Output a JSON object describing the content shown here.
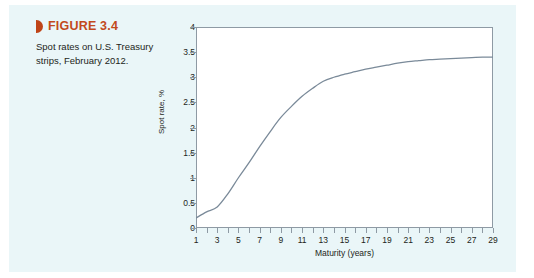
{
  "figure": {
    "marker_icon": "triangle-right-icon",
    "label": "FIGURE 3.4",
    "description": "Spot rates on U.S. Treasury strips, February 2012.",
    "heading_color": "#c2491c",
    "marker_color": "#bf4417",
    "panel_background": "#eaf6f8"
  },
  "chart_data": {
    "type": "line",
    "title": "",
    "xlabel": "Maturity (years)",
    "ylabel": "Spot rate, %",
    "xlim": [
      1,
      29
    ],
    "ylim": [
      0,
      4
    ],
    "grid": false,
    "legend": "none",
    "line_color": "#7a8a99",
    "plot_background": "#ffffff",
    "axis_color": "#8e9aa4",
    "ytick_labels": [
      "0",
      "0.5",
      "1",
      "1.5",
      "2",
      "2.5",
      "3",
      "3.5",
      "4"
    ],
    "ytick_values": [
      0,
      0.5,
      1,
      1.5,
      2,
      2.5,
      3,
      3.5,
      4
    ],
    "xtick_labels": [
      "1",
      "3",
      "5",
      "7",
      "9",
      "11",
      "13",
      "15",
      "17",
      "19",
      "21",
      "23",
      "25",
      "27",
      "29"
    ],
    "xtick_values": [
      1,
      3,
      5,
      7,
      9,
      11,
      13,
      15,
      17,
      19,
      21,
      23,
      25,
      27,
      29
    ],
    "xtick_minor_values": [
      2,
      4,
      6,
      8,
      10,
      12,
      14,
      16,
      18,
      20,
      22,
      24,
      26,
      28
    ],
    "x": [
      1,
      2,
      3,
      4,
      5,
      6,
      7,
      8,
      9,
      10,
      11,
      12,
      13,
      14,
      15,
      16,
      17,
      18,
      19,
      20,
      21,
      22,
      23,
      24,
      25,
      26,
      27,
      28,
      29
    ],
    "values": [
      0.2,
      0.32,
      0.42,
      0.68,
      1.0,
      1.3,
      1.62,
      1.92,
      2.2,
      2.42,
      2.62,
      2.78,
      2.92,
      3.0,
      3.06,
      3.11,
      3.16,
      3.2,
      3.24,
      3.28,
      3.31,
      3.33,
      3.35,
      3.36,
      3.37,
      3.38,
      3.39,
      3.4,
      3.4
    ]
  }
}
